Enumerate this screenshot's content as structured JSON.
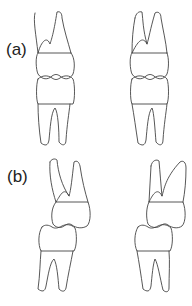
{
  "figure": {
    "panels": [
      {
        "id": "a",
        "label": "(a)",
        "description": "Upper and lower teeth in aligned occlusion (two views)"
      },
      {
        "id": "b",
        "label": "(b)",
        "description": "Upper and lower teeth in offset occlusion (two views)"
      }
    ],
    "colors": {
      "stroke": "#444444",
      "background": "#ffffff",
      "text": "#222222"
    }
  }
}
